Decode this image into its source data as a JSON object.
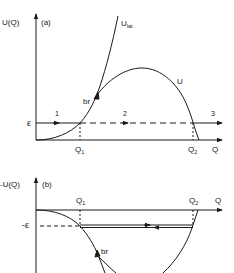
{
  "panel_a": {
    "tag": "(a)",
    "y_label": "U(Q)",
    "x_label": "Q",
    "energy_label": "ε",
    "q1_label": "Q",
    "q1_sub": "1",
    "q2_label": "Q",
    "q2_sub": "2",
    "curve_lat_label": "U",
    "curve_lat_sub": "lat",
    "curve_u_label": "U",
    "branch_label": "br",
    "regions": [
      "1",
      "2",
      "3"
    ]
  },
  "panel_b": {
    "tag": "(b)",
    "y_label": "-U(Q)",
    "x_label": "Q",
    "energy_label": "-ε",
    "q1_label": "Q",
    "q1_sub": "1",
    "q2_label": "Q",
    "q2_sub": "2",
    "branch_label": "br"
  },
  "colors": {
    "ink": "#1a1a1a",
    "background": "#ffffff"
  }
}
